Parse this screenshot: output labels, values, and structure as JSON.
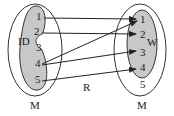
{
  "left_set": {
    "outer_label": "M",
    "inner_label": "ID",
    "elements": [
      "1",
      "2",
      "3",
      "4",
      "5"
    ]
  },
  "right_set": {
    "outer_label": "M",
    "inner_label": "W",
    "elements": [
      "1",
      "2",
      "3",
      "4",
      "5"
    ]
  },
  "relation_label": "R",
  "mappings": [
    {
      "from": "1",
      "to": "1"
    },
    {
      "from": "2",
      "to": "2"
    },
    {
      "from": "4",
      "to": "1"
    },
    {
      "from": "4",
      "to": "3"
    },
    {
      "from": "5",
      "to": "4"
    }
  ],
  "colors": {
    "inner_fill": "#c8c8c8",
    "stroke": "#333333"
  }
}
